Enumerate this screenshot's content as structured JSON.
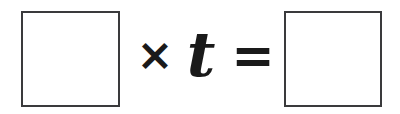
{
  "canvas": {
    "width": 400,
    "height": 114,
    "background_color": "#ffffff"
  },
  "equation": {
    "description": "Fill-in-the-blank multiplication equation",
    "box_border_color": "#3a3a3c",
    "glyph_color": "#1a1a1a",
    "terms": [
      {
        "id": "box-left",
        "kind": "blank-box",
        "name": "left-answer-box",
        "value": ""
      },
      {
        "id": "times-symbol",
        "kind": "operator",
        "name": "multiplication-sign",
        "value": "×"
      },
      {
        "id": "variable-t",
        "kind": "variable",
        "name": "variable-t",
        "value": "t"
      },
      {
        "id": "equals-symbol",
        "kind": "operator",
        "name": "equals-sign",
        "value": "="
      },
      {
        "id": "box-right",
        "kind": "blank-box",
        "name": "right-answer-box",
        "value": ""
      }
    ]
  }
}
